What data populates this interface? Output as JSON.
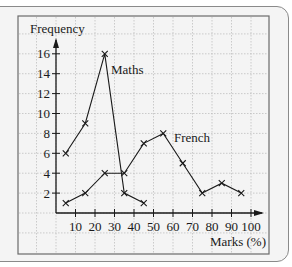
{
  "chart_data": {
    "type": "line",
    "title": "",
    "xlabel": "Marks (%)",
    "ylabel": "Frequency",
    "x_ticks": [
      10,
      20,
      30,
      40,
      50,
      60,
      70,
      80,
      90,
      100
    ],
    "y_ticks": [
      2,
      4,
      6,
      8,
      10,
      12,
      14,
      16
    ],
    "xlim": [
      0,
      100
    ],
    "ylim": [
      0,
      16
    ],
    "grid": true,
    "legend": "inline labels",
    "series": [
      {
        "name": "Maths",
        "x": [
          5,
          15,
          25,
          35,
          45
        ],
        "values": [
          6,
          9,
          16,
          2,
          1
        ]
      },
      {
        "name": "French",
        "x": [
          5,
          15,
          25,
          35,
          45,
          55,
          65,
          75,
          85,
          95
        ],
        "values": [
          1,
          2,
          4,
          4,
          7,
          8,
          5,
          2,
          3,
          2
        ]
      }
    ],
    "annotations": [
      {
        "text": "Maths",
        "near": [
          25,
          16
        ]
      },
      {
        "text": "French",
        "near": [
          55,
          8
        ]
      }
    ]
  },
  "labels": {
    "ylabel": "Frequency",
    "xlabel": "Marks (%)",
    "maths": "Maths",
    "french": "French"
  },
  "colors": {
    "line": "#1a1a1a",
    "grid": "#b8b8b8",
    "background": "#f4f4f4",
    "frame": "#6a6a6a"
  }
}
